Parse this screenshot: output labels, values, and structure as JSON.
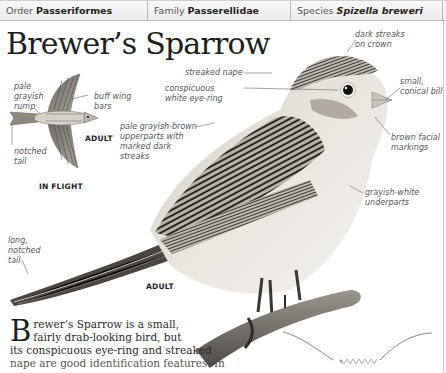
{
  "header": {
    "order_label": "Order",
    "order_value": "Passeriformes",
    "family_label": "Family",
    "family_value": "Passerellidae",
    "species_label": "Species",
    "species_value": "Spizella breweri"
  },
  "title": "Brewer’s Sparrow",
  "flight_figure": {
    "labels": {
      "rump": "pale\ngrayish\nrump",
      "wing_bars": "buff wing\nbars",
      "tail": "notched\ntail"
    },
    "adult_tag": "ADULT",
    "caption": "IN FLIGHT"
  },
  "main_figure": {
    "labels": {
      "crown": "dark streaks\non crown",
      "nape": "streaked nape",
      "eye_ring": "conspicuous\nwhite eye-ring",
      "bill": "small,\nconical bill",
      "upperparts": "pale grayish-brown\nupperparts with\nmarked dark\nstreaks",
      "facial": "brown facial\nmarkings",
      "underparts": "grayish-white\nunderparts",
      "long_tail": "long,\nnotched\ntail"
    },
    "adult_tag": "ADULT"
  },
  "intro_text": {
    "dropcap": "B",
    "line1": "rewer’s Sparrow is a small,",
    "line2": "fairly drab-looking bird, but",
    "line3": "its conspicuous eye-ring and streaked",
    "line4": "nape are good identification features. In"
  },
  "colors": {
    "header_bg": "#efefef",
    "header_border": "#b9b9b9",
    "label_text": "#555555",
    "leader_line": "#666666",
    "flight_path": "#8a8a8a"
  }
}
